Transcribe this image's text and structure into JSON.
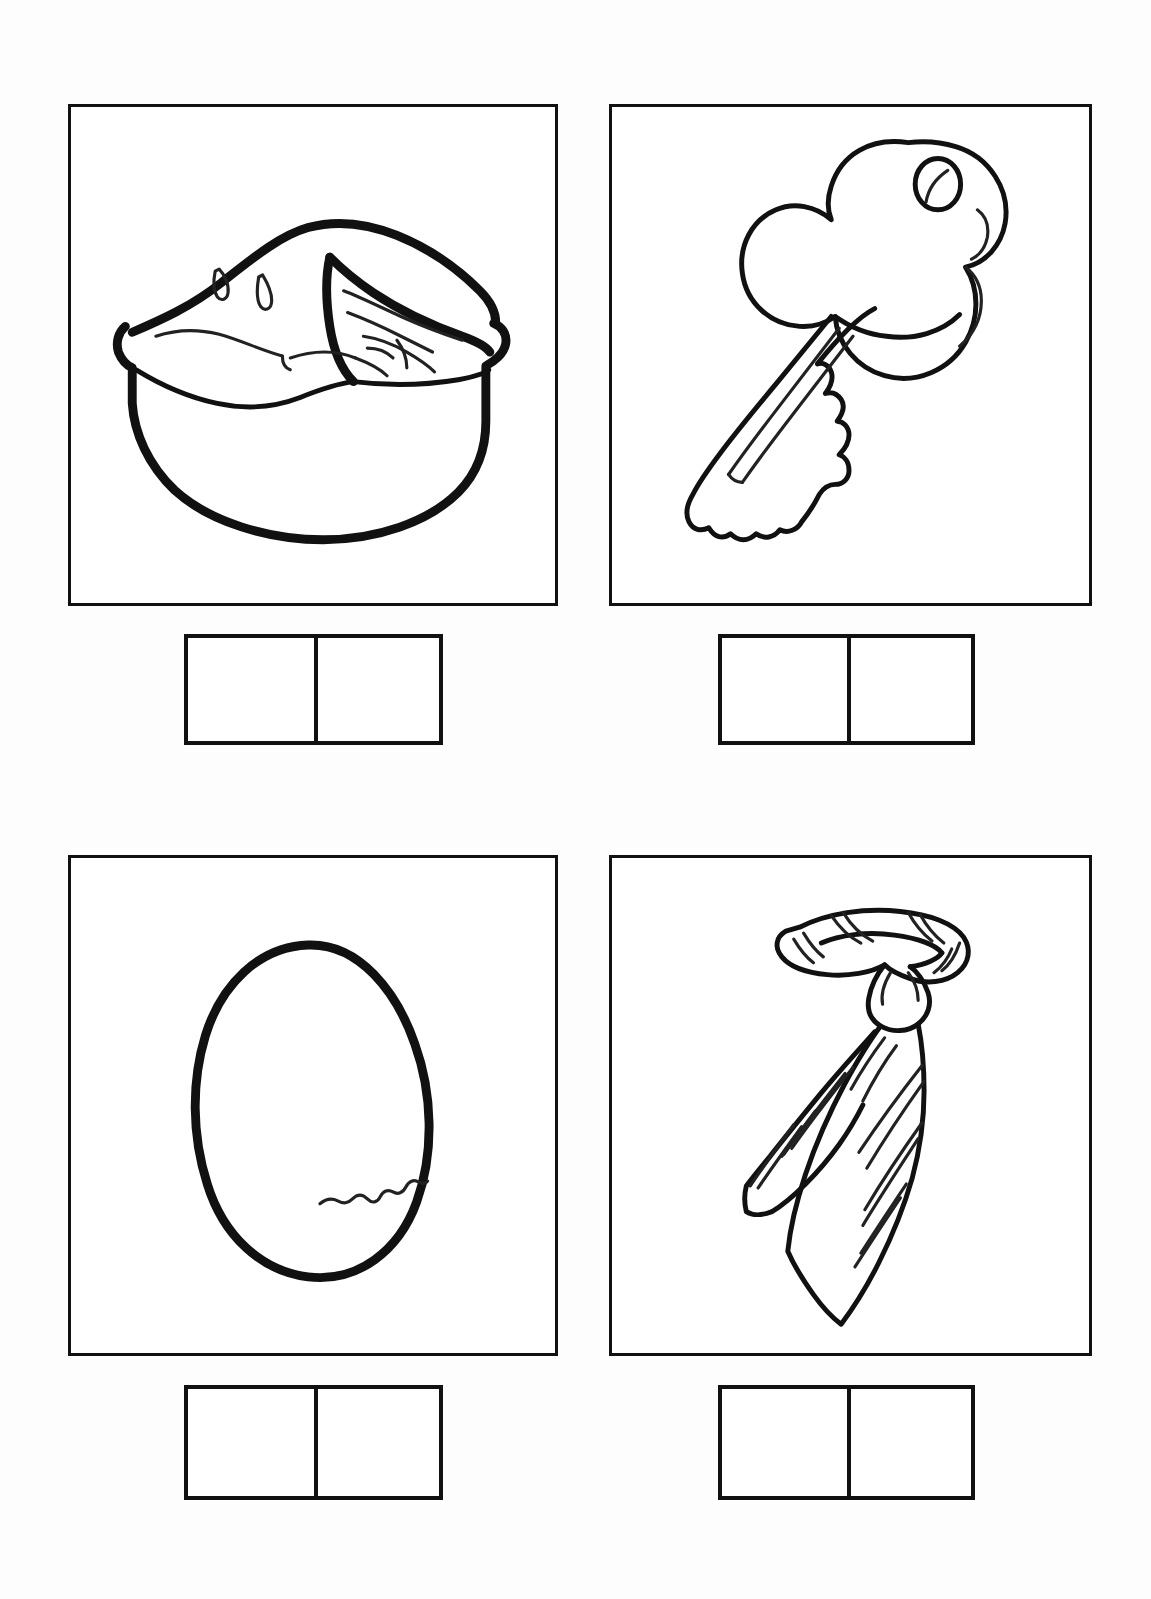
{
  "page": {
    "kind": "phonics-picture-worksheet",
    "background_color": "#fdfdfd",
    "ink_color": "#111111",
    "columns": 2,
    "rows": 2,
    "title": "",
    "instructions": ""
  },
  "items": [
    {
      "id": "item-1",
      "position": "top-left",
      "picture_name": "pie",
      "picture_description": "A whole pie in a pie dish with one wedge slice cut out, steam vents on the crust",
      "answer_box": {
        "cells": 2,
        "cell_values": [
          "",
          ""
        ]
      }
    },
    {
      "id": "item-2",
      "position": "top-right",
      "picture_name": "key",
      "picture_description": "A door key with a clover shaped bow, a keyring hole, and a toothed blade pointing down-left",
      "answer_box": {
        "cells": 2,
        "cell_values": [
          "",
          ""
        ]
      }
    },
    {
      "id": "item-3",
      "position": "bottom-left",
      "picture_name": "egg",
      "picture_description": "An oval egg with a small zigzag crack on the lower right side",
      "answer_box": {
        "cells": 2,
        "cell_values": [
          "",
          ""
        ]
      }
    },
    {
      "id": "item-4",
      "position": "bottom-right",
      "picture_name": "tie",
      "picture_description": "A diagonally striped necktie tied in a knot with the collar loop at the top",
      "answer_box": {
        "cells": 2,
        "cell_values": [
          "",
          ""
        ]
      }
    }
  ]
}
